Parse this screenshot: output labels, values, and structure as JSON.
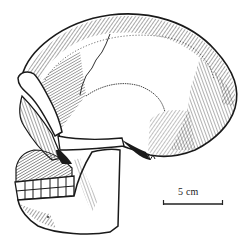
{
  "figure": {
    "style": "pen-and-ink",
    "ink_color": "#1a1a1a",
    "background": "#ffffff"
  },
  "scale_bar": {
    "label": "5 cm",
    "color": "#222222"
  }
}
